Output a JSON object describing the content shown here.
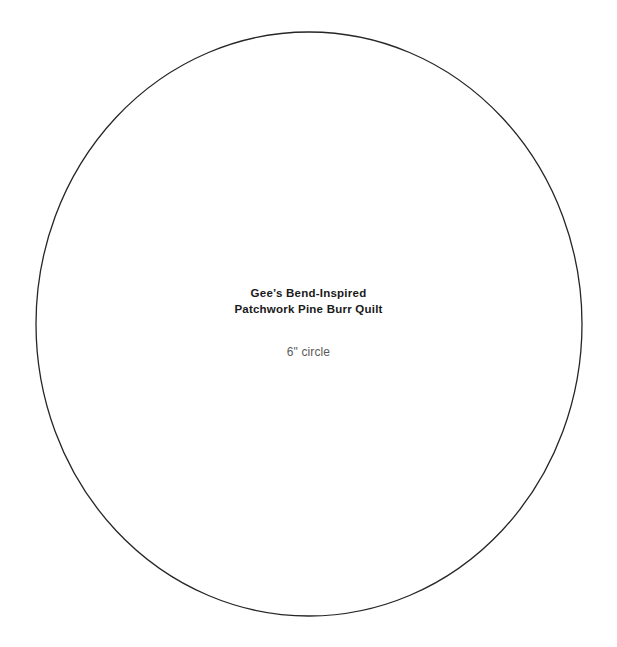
{
  "canvas": {
    "width": 617,
    "height": 647,
    "background": "#ffffff"
  },
  "shape": {
    "kind": "circle-outline",
    "center_x": 309,
    "center_y": 324,
    "radius_x": 273,
    "radius_y": 292,
    "stroke_color": "#262626",
    "stroke_width": 1.3,
    "fill": "none"
  },
  "label": {
    "title_line_1": "Gee’s Bend-Inspired",
    "title_line_2": "Patchwork Pine Burr Quilt",
    "title_color": "#1a1a1a",
    "subtitle": "6\" circle",
    "subtitle_color": "#5a5a5a"
  }
}
